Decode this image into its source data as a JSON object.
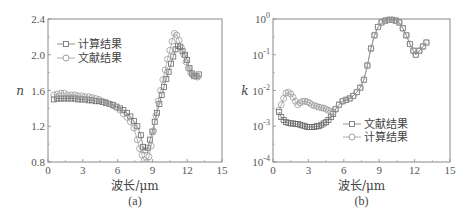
{
  "chart_data": [
    {
      "type": "scatter",
      "panel_label": "(a)",
      "title": "",
      "xlabel": "波长/μm",
      "ylabel": "n",
      "xlim": [
        0,
        15
      ],
      "ylim": [
        0.8,
        2.4
      ],
      "yscale": "linear",
      "xticks": [
        0,
        3,
        6,
        9,
        12,
        15
      ],
      "xtick_labels": [
        "0",
        "3",
        "6",
        "9",
        "12",
        "15"
      ],
      "yticks": [
        0.8,
        1.2,
        1.6,
        2.0,
        2.4
      ],
      "ytick_labels": [
        "0.8",
        "1.2",
        "1.6",
        "2.0",
        "2.4"
      ],
      "grid": false,
      "legend_position": "top-left",
      "series": [
        {
          "name": "计算结果",
          "marker": "square",
          "x": [
            0.5,
            0.8,
            1.1,
            1.4,
            1.7,
            2.0,
            2.3,
            2.6,
            2.9,
            3.2,
            3.5,
            3.8,
            4.1,
            4.4,
            4.7,
            5.0,
            5.3,
            5.6,
            5.9,
            6.2,
            6.5,
            6.8,
            7.1,
            7.4,
            7.7,
            8.0,
            8.2,
            8.4,
            8.6,
            8.8,
            9.0,
            9.2,
            9.4,
            9.6,
            9.8,
            10.0,
            10.2,
            10.4,
            10.6,
            10.8,
            11.0,
            11.2,
            11.4,
            11.6,
            11.8,
            12.0,
            12.2,
            12.4,
            12.6,
            12.8,
            13.0
          ],
          "y": [
            1.5,
            1.51,
            1.51,
            1.51,
            1.51,
            1.51,
            1.51,
            1.5,
            1.5,
            1.5,
            1.49,
            1.49,
            1.48,
            1.48,
            1.47,
            1.46,
            1.45,
            1.44,
            1.42,
            1.4,
            1.38,
            1.35,
            1.31,
            1.26,
            1.2,
            1.1,
            0.97,
            0.93,
            0.96,
            1.05,
            1.14,
            1.25,
            1.35,
            1.45,
            1.55,
            1.64,
            1.73,
            1.81,
            1.9,
            1.98,
            2.06,
            2.1,
            2.09,
            2.04,
            2.0,
            1.94,
            1.85,
            1.79,
            1.76,
            1.76,
            1.78
          ]
        },
        {
          "name": "文献结果",
          "marker": "circle",
          "x": [
            0.5,
            0.8,
            1.1,
            1.4,
            1.7,
            2.0,
            2.3,
            2.6,
            2.9,
            3.2,
            3.5,
            3.8,
            4.1,
            4.4,
            4.7,
            5.0,
            5.3,
            5.6,
            5.9,
            6.2,
            6.5,
            6.8,
            7.1,
            7.4,
            7.7,
            7.9,
            8.1,
            8.3,
            8.5,
            8.7,
            8.9,
            9.1,
            9.3,
            9.5,
            9.7,
            9.9,
            10.1,
            10.3,
            10.5,
            10.7,
            10.9,
            11.1,
            11.3,
            11.5,
            11.7,
            11.9,
            12.1,
            12.3,
            12.5,
            12.7,
            12.9
          ],
          "y": [
            1.55,
            1.56,
            1.57,
            1.57,
            1.55,
            1.55,
            1.55,
            1.54,
            1.54,
            1.53,
            1.53,
            1.52,
            1.51,
            1.5,
            1.48,
            1.47,
            1.45,
            1.43,
            1.41,
            1.38,
            1.34,
            1.3,
            1.25,
            1.18,
            1.05,
            0.95,
            0.88,
            0.82,
            0.8,
            0.86,
            0.98,
            1.15,
            1.32,
            1.48,
            1.6,
            1.72,
            1.83,
            1.95,
            2.05,
            2.15,
            2.24,
            2.22,
            2.16,
            2.08,
            2.0,
            1.92,
            1.85,
            1.8,
            1.77,
            1.76,
            1.75
          ]
        }
      ]
    },
    {
      "type": "scatter",
      "panel_label": "(b)",
      "title": "",
      "xlabel": "波长/μm",
      "ylabel": "k",
      "xlim": [
        0,
        15
      ],
      "ylim_log10": [
        -4,
        0
      ],
      "yscale": "log",
      "xticks": [
        0,
        3,
        6,
        9,
        12,
        15
      ],
      "xtick_labels": [
        "0",
        "3",
        "6",
        "9",
        "12",
        "15"
      ],
      "yticks_log10": [
        -4,
        -3,
        -2,
        -1,
        0
      ],
      "ytick_labels": [
        {
          "base": "10",
          "exp": "-4"
        },
        {
          "base": "10",
          "exp": "-3"
        },
        {
          "base": "10",
          "exp": "-2"
        },
        {
          "base": "10",
          "exp": "-1"
        },
        {
          "base": "10",
          "exp": "0"
        }
      ],
      "grid": false,
      "legend_position": "bottom-right",
      "series": [
        {
          "name": "文献结果",
          "marker": "square",
          "x": [
            0.5,
            0.7,
            0.9,
            1.1,
            1.3,
            1.5,
            1.7,
            1.9,
            2.1,
            2.3,
            2.5,
            2.7,
            2.9,
            3.1,
            3.3,
            3.5,
            3.7,
            3.9,
            4.1,
            4.3,
            4.5,
            4.7,
            4.9,
            5.1,
            5.3,
            5.6,
            5.9,
            6.2,
            6.5,
            6.8,
            7.1,
            7.4,
            7.7,
            8.0,
            8.3,
            8.6,
            8.9,
            9.2,
            9.5,
            9.8,
            10.1,
            10.4,
            10.7,
            11.0,
            11.3,
            11.6,
            11.9,
            12.1,
            12.4,
            12.7,
            13.0
          ],
          "y": [
            0.0025,
            0.0018,
            0.0015,
            0.0013,
            0.00125,
            0.0012,
            0.0012,
            0.00115,
            0.00115,
            0.0011,
            0.00105,
            0.001,
            0.00095,
            0.00095,
            0.00095,
            0.00095,
            0.001,
            0.001,
            0.0011,
            0.0012,
            0.0013,
            0.0015,
            0.0018,
            0.0022,
            0.003,
            0.004,
            0.005,
            0.0055,
            0.006,
            0.007,
            0.009,
            0.012,
            0.02,
            0.05,
            0.15,
            0.35,
            0.6,
            0.8,
            0.9,
            0.95,
            0.95,
            0.9,
            0.8,
            0.55,
            0.35,
            0.2,
            0.13,
            0.1,
            0.13,
            0.17,
            0.22
          ]
        },
        {
          "name": "计算结果",
          "marker": "circle",
          "x": [
            0.5,
            0.7,
            0.9,
            1.1,
            1.3,
            1.5,
            1.7,
            1.9,
            2.1,
            2.3,
            2.5,
            2.7,
            2.9,
            3.1,
            3.3,
            3.5,
            3.7,
            3.9,
            4.1,
            4.3,
            4.5,
            4.7,
            4.9,
            5.1,
            5.3,
            5.6,
            5.9,
            6.2,
            6.5,
            6.8,
            7.1,
            7.4,
            7.7,
            8.0,
            8.3,
            8.6,
            8.9,
            9.2,
            9.5,
            9.8,
            10.1,
            10.4,
            10.7,
            11.0,
            11.3,
            11.6,
            11.9,
            12.1,
            12.4,
            12.7,
            13.0
          ],
          "y": [
            0.0028,
            0.004,
            0.006,
            0.0085,
            0.009,
            0.008,
            0.0065,
            0.005,
            0.004,
            0.0045,
            0.005,
            0.005,
            0.0048,
            0.0045,
            0.004,
            0.0038,
            0.0036,
            0.0034,
            0.0033,
            0.0032,
            0.003,
            0.0028,
            0.0026,
            0.0025,
            0.003,
            0.004,
            0.005,
            0.0055,
            0.006,
            0.007,
            0.009,
            0.012,
            0.02,
            0.05,
            0.15,
            0.35,
            0.6,
            0.8,
            0.9,
            0.95,
            0.95,
            0.9,
            0.8,
            0.55,
            0.35,
            0.2,
            0.13,
            0.1,
            0.13,
            0.17,
            0.22
          ]
        }
      ]
    }
  ]
}
